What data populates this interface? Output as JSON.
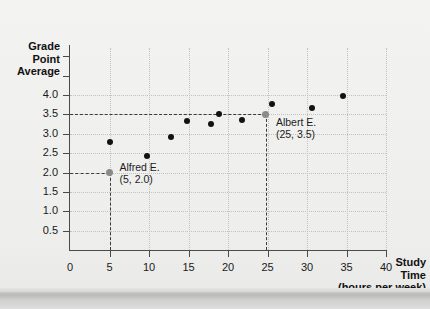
{
  "chart_data": {
    "type": "scatter",
    "title": "",
    "xlabel": "Study Time (hours per week)",
    "ylabel": "Grade Point Average",
    "xlim": [
      0,
      40
    ],
    "ylim": [
      0,
      4.25
    ],
    "grid": true,
    "legend": "none",
    "x": [
      5,
      5,
      9.8,
      12.8,
      14.8,
      17.8,
      18.8,
      21.8,
      24.8,
      25.6,
      30.6,
      34.6
    ],
    "y": [
      2.0,
      2.8,
      2.43,
      2.92,
      3.33,
      3.24,
      3.52,
      3.36,
      3.5,
      3.77,
      3.67,
      3.98
    ],
    "points": [
      {
        "x": 5,
        "y": 2.0,
        "highlight": true,
        "label": "Alfred E."
      },
      {
        "x": 5,
        "y": 2.8,
        "highlight": false,
        "label": ""
      },
      {
        "x": 9.8,
        "y": 2.43,
        "highlight": false,
        "label": ""
      },
      {
        "x": 12.8,
        "y": 2.92,
        "highlight": false,
        "label": ""
      },
      {
        "x": 14.8,
        "y": 3.33,
        "highlight": false,
        "label": ""
      },
      {
        "x": 17.8,
        "y": 3.24,
        "highlight": false,
        "label": ""
      },
      {
        "x": 18.8,
        "y": 3.52,
        "highlight": false,
        "label": ""
      },
      {
        "x": 21.8,
        "y": 3.36,
        "highlight": false,
        "label": ""
      },
      {
        "x": 24.8,
        "y": 3.5,
        "highlight": true,
        "label": "Albert E."
      },
      {
        "x": 25.6,
        "y": 3.77,
        "highlight": false,
        "label": ""
      },
      {
        "x": 30.6,
        "y": 3.67,
        "highlight": false,
        "label": ""
      },
      {
        "x": 34.6,
        "y": 3.98,
        "highlight": false,
        "label": ""
      }
    ],
    "xticks": [
      0,
      5,
      10,
      15,
      20,
      25,
      30,
      35,
      40
    ],
    "xtick_labels": [
      "0",
      "5",
      "10",
      "15",
      "20",
      "25",
      "30",
      "35",
      "40"
    ],
    "yticks": [
      0.5,
      1.0,
      1.5,
      2.0,
      2.5,
      3.0,
      3.5,
      4.0
    ],
    "ytick_labels": [
      "0.5",
      "1.0",
      "1.5",
      "2.0",
      "2.5",
      "3.0",
      "3.5",
      "4.0"
    ],
    "annotations": [
      {
        "name": "Alfred E.",
        "coords": "(5, 2.0)",
        "x": 5,
        "y": 2.0
      },
      {
        "name": "Albert E.",
        "coords": "(25, 3.5)",
        "x": 25,
        "y": 3.5
      }
    ]
  },
  "axis_titles": {
    "y_line1": "Grade",
    "y_line2": "Point",
    "y_line3": "Average",
    "x_line1": "Study",
    "x_line2": "Time",
    "x_line3": "(hours per week)"
  },
  "annotations": {
    "alfred_name": "Alfred E.",
    "alfred_coords": "(5, 2.0)",
    "albert_name": "Albert E.",
    "albert_coords": "(25, 3.5)"
  },
  "colors": {
    "marker": "#121212",
    "marker_highlight": "#8a8a8a",
    "axis": "#4a4a4a",
    "grid": "#c2c2c0",
    "background": "#f0f0ef",
    "text": "#1a1a1a"
  }
}
